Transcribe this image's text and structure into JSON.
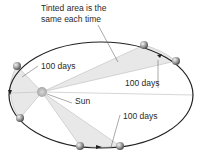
{
  "diagram": {
    "caption_line1": "Tinted area is the",
    "caption_line2": "same each time",
    "labels": {
      "top_left_interval": "100 days",
      "top_right_interval": "100 days",
      "bottom_interval": "100 days",
      "sun": "Sun"
    },
    "colors": {
      "orbit": "#222222",
      "tint": "#e6e6e6",
      "ray": "#bdbdbd",
      "planet": "#9a9a9a",
      "sun": "#b0b0b0"
    }
  }
}
